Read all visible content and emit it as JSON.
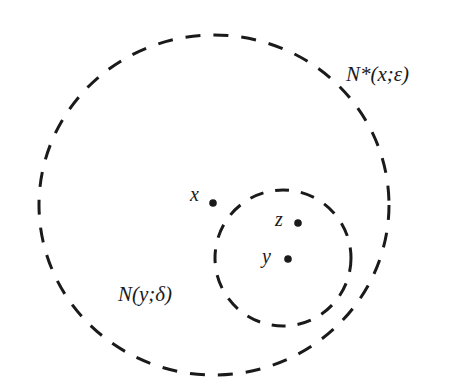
{
  "diagram": {
    "type": "neighborhood-diagram",
    "outer_neighborhood": {
      "label": "N*(x;ε)",
      "style": "dashed",
      "center": [
        214,
        205
      ],
      "radius_x": 175,
      "radius_y": 170
    },
    "inner_neighborhood": {
      "label": "N(y;δ)",
      "style": "dashed",
      "center": [
        283,
        258
      ],
      "radius": 68
    },
    "points": [
      {
        "label": "x",
        "position": [
          213,
          203
        ]
      },
      {
        "label": "z",
        "position": [
          298,
          223
        ]
      },
      {
        "label": "y",
        "position": [
          288,
          259
        ]
      }
    ],
    "colors": {
      "stroke": "#1a1a1a",
      "background": "#ffffff"
    }
  }
}
